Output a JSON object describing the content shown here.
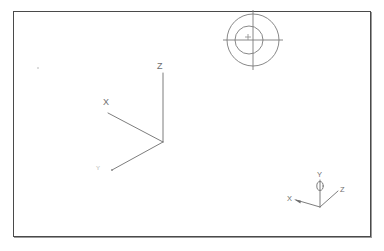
{
  "app": {
    "title": "CAD Drawing Viewport",
    "background_color": "#ffffff",
    "line_color": "#6e6e6e",
    "frame_color": "#4a4a4a",
    "frame_shadow_color": "#9a9a9a"
  },
  "viewport": {
    "name": "drawing-area",
    "x": 13,
    "y": 11,
    "width": 358,
    "height": 226
  },
  "ucs_icon": {
    "name": "ucs-icon",
    "description": "Large 3D UCS axis indicator",
    "origin": {
      "x": 163,
      "y": 142
    },
    "axes": [
      {
        "axis": "Z",
        "label": "Z",
        "label_x": 157,
        "label_y": 62,
        "tip_x": 163,
        "tip_y": 73
      },
      {
        "axis": "X",
        "label": "X",
        "label_x": 103,
        "label_y": 98,
        "tip_x": 108,
        "tip_y": 113
      },
      {
        "axis": "Y",
        "label": "Y",
        "label_x": 96,
        "label_y": 165,
        "tip_x": 112,
        "tip_y": 170
      }
    ]
  },
  "compass": {
    "name": "compass-indicator",
    "description": "Circular compass / donut view indicator",
    "center_x": 253,
    "center_y": 40,
    "outer_radius": 26,
    "inner_radius": 14,
    "marker": "+",
    "marker_x": 249,
    "marker_y": 40
  },
  "wcs_icon": {
    "name": "wcs-axis-triad",
    "description": "Small world coordinate system triad",
    "origin": {
      "x": 320,
      "y": 207
    },
    "axes": [
      {
        "axis": "Y",
        "label": "Y",
        "label_x": 317,
        "label_y": 171,
        "tip_x": 320,
        "tip_y": 180
      },
      {
        "axis": "X",
        "label": "X",
        "label_x": 287,
        "label_y": 195,
        "tip_x": 296,
        "tip_y": 200
      },
      {
        "axis": "Z",
        "label": "Z",
        "label_x": 340,
        "label_y": 186,
        "tip_x": 338,
        "tip_y": 191
      }
    ],
    "y_ring": {
      "cx": 320,
      "cy": 186,
      "rx": 3.2,
      "ry": 4.4
    }
  },
  "artifacts": {
    "speck": {
      "x": 37,
      "y": 67
    }
  }
}
